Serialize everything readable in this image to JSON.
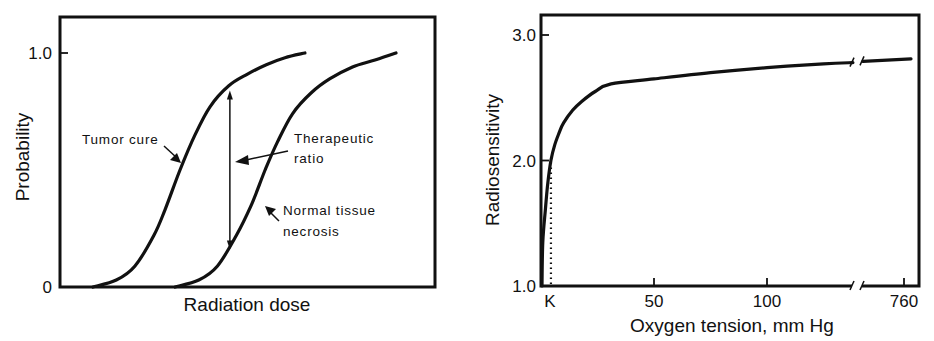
{
  "chart_data": [
    {
      "type": "line",
      "title": "",
      "xlabel": "Radiation dose",
      "ylabel": "Probability",
      "xlim": [
        0,
        100
      ],
      "ylim": [
        0,
        1.1
      ],
      "x_units": "arbitrary (no tick values shown)",
      "yticks": [
        0,
        1.0
      ],
      "ytick_labels": [
        "0",
        "1.0"
      ],
      "xticks": [],
      "grid": false,
      "series": [
        {
          "name": "Tumor cure",
          "x": [
            8.8,
            15,
            20,
            25,
            28,
            32,
            36,
            40,
            45,
            50,
            55,
            60,
            65.3
          ],
          "y": [
            0.0,
            0.03,
            0.09,
            0.22,
            0.33,
            0.5,
            0.65,
            0.77,
            0.86,
            0.91,
            0.95,
            0.98,
            1.0
          ]
        },
        {
          "name": "Normal tissue necrosis",
          "x": [
            30.7,
            37,
            42,
            47,
            51,
            54.7,
            58,
            62,
            67,
            72,
            78,
            84,
            89.6
          ],
          "y": [
            0.0,
            0.03,
            0.09,
            0.22,
            0.35,
            0.5,
            0.62,
            0.74,
            0.83,
            0.89,
            0.94,
            0.97,
            1.0
          ]
        }
      ],
      "annotations": [
        {
          "text": "Tumor cure",
          "points_to": "Tumor cure"
        },
        {
          "text_lines": [
            "Therapeutic",
            "ratio"
          ],
          "points_to": "double-headed arrow between curves",
          "arrow_x": 45.3,
          "arrow_y_range": [
            0.16,
            0.84
          ]
        },
        {
          "text_lines": [
            "Normal tissue",
            "necrosis"
          ],
          "points_to": "Normal tissue necrosis"
        }
      ]
    },
    {
      "type": "line",
      "title": "",
      "xlabel": "Oxygen tension, mm Hg",
      "ylabel": "Radiosensitivity",
      "ylim": [
        1.0,
        3.16
      ],
      "xlim": [
        0,
        150
      ],
      "axis_break": {
        "between": [
          140,
          760
        ],
        "marker": "double slash"
      },
      "yticks": [
        1.0,
        2.0,
        3.0
      ],
      "ytick_labels": [
        "1.0",
        "2.0",
        "3.0"
      ],
      "xticks": [
        "K",
        50,
        100,
        760
      ],
      "xtick_labels": [
        "K",
        "50",
        "100",
        "760"
      ],
      "grid": false,
      "series": [
        {
          "name": "Radiosensitivity",
          "x": [
            0.8,
            2,
            3,
            4.4,
            6,
            8,
            10,
            14,
            18,
            24,
            31,
            50,
            75,
            100,
            125,
            138
          ],
          "y": [
            1.35,
            1.62,
            1.82,
            2.0,
            2.12,
            2.22,
            2.3,
            2.4,
            2.47,
            2.55,
            2.61,
            2.65,
            2.7,
            2.74,
            2.77,
            2.78
          ]
        },
        {
          "name": "Radiosensitivity (after break)",
          "x": [
            760
          ],
          "y": [
            2.81
          ],
          "segment_from_break": 2.79
        }
      ],
      "reference_line": {
        "style": "dotted",
        "x": "K",
        "x_value": 4.4,
        "y_range": [
          1.0,
          2.0
        ]
      }
    }
  ]
}
